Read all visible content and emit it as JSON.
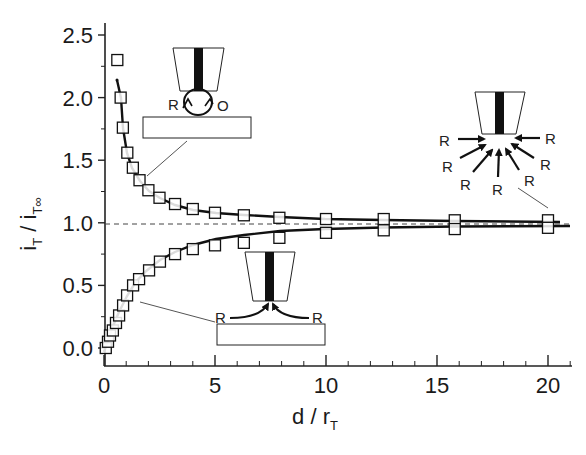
{
  "chart_data": {
    "type": "scatter",
    "title": "",
    "xlabel": "d / r_T",
    "ylabel": "i_T / i_T∞",
    "xlim": [
      0,
      21
    ],
    "ylim": [
      0,
      2.6
    ],
    "x_ticks": [
      "0",
      "5",
      "10",
      "15",
      "20"
    ],
    "y_ticks": [
      "0.0",
      "0.5",
      "1.0",
      "1.5",
      "2.0",
      "2.5"
    ],
    "grid": false,
    "reference_line": {
      "y": 1.0,
      "style": "dashed"
    },
    "series": [
      {
        "name": "positive feedback (conductor)",
        "marker": "open-square",
        "x": [
          0.6,
          0.75,
          0.85,
          1.05,
          1.3,
          1.6,
          2.0,
          2.5,
          3.2,
          4.0,
          5.0,
          6.3,
          7.9,
          10.0,
          12.6,
          15.8,
          20.0
        ],
        "y": [
          2.3,
          2.0,
          1.76,
          1.56,
          1.44,
          1.34,
          1.26,
          1.2,
          1.15,
          1.11,
          1.08,
          1.06,
          1.04,
          1.03,
          1.03,
          1.02,
          1.02
        ]
      },
      {
        "name": "negative feedback (insulator)",
        "marker": "open-square",
        "x": [
          0.08,
          0.18,
          0.27,
          0.4,
          0.54,
          0.68,
          0.86,
          1.04,
          1.31,
          1.58,
          2.03,
          2.52,
          3.2,
          4.0,
          5.0,
          6.3,
          7.9,
          10.0,
          12.6,
          15.8,
          20.0
        ],
        "y": [
          0.0,
          0.05,
          0.1,
          0.14,
          0.2,
          0.26,
          0.34,
          0.42,
          0.5,
          0.55,
          0.62,
          0.69,
          0.75,
          0.79,
          0.82,
          0.84,
          0.88,
          0.92,
          0.94,
          0.95,
          0.96
        ]
      }
    ],
    "annotations": [
      {
        "label": "positive feedback schematic",
        "text": [
          "R",
          "O"
        ]
      },
      {
        "label": "bulk diffusion schematic",
        "text": [
          "R",
          "R",
          "R",
          "R",
          "R",
          "R",
          "R"
        ]
      },
      {
        "label": "negative feedback schematic",
        "text": [
          "R",
          "R"
        ]
      }
    ]
  },
  "axes": {
    "x_title": "d / r",
    "x_title_sub": "T",
    "y_title_num": "i",
    "y_title_num_sub": "T",
    "y_title_sep": "/",
    "y_title_den": "i",
    "y_title_den_sub": "T∞"
  },
  "annotations": {
    "top_left": {
      "left_label": "R",
      "right_label": "O"
    },
    "right": {
      "labels": [
        "R",
        "R",
        "R",
        "R",
        "R",
        "R",
        "R"
      ]
    },
    "bottom": {
      "left_label": "R",
      "right_label": "R"
    }
  }
}
